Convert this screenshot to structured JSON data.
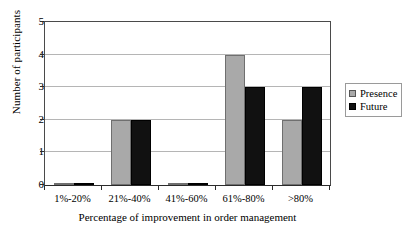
{
  "chart_data": {
    "type": "bar",
    "title": "",
    "xlabel": "Percentage of improvement in order management",
    "ylabel": "Number of participants",
    "categories": [
      "1%-20%",
      "21%-40%",
      "41%-60%",
      "61%-80%",
      ">80%"
    ],
    "series": [
      {
        "name": "Presence",
        "color": "#a9a9a9",
        "values": [
          0.05,
          2,
          0.05,
          4,
          2
        ]
      },
      {
        "name": "Future",
        "color": "#111111",
        "values": [
          0.05,
          2,
          0.05,
          3,
          3
        ]
      }
    ],
    "ylim": [
      0,
      5
    ],
    "yticks": [
      0,
      1,
      2,
      3,
      4,
      5
    ],
    "ytick_labels": [
      "0",
      "1",
      "2",
      "3",
      "4",
      "5"
    ],
    "grid": true,
    "grid_axis": "y",
    "legend_position": "right",
    "legend_entries": [
      "Presence",
      "Future"
    ]
  }
}
